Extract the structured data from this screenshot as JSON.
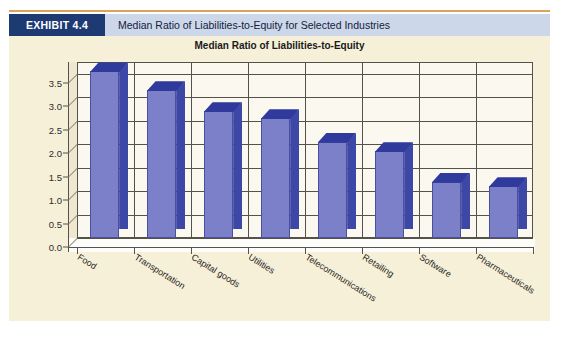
{
  "exhibit": {
    "badge_label": "EXHIBIT 4.4",
    "caption": "Median Ratio of Liabilities-to-Equity for Selected Industries",
    "badge_color": "#1e3a73",
    "caption_bg": "#ccd7ea",
    "panel_bg": "#f7f0d8",
    "rule_color": "#d9a55a"
  },
  "chart_data": {
    "type": "bar",
    "title": "Median Ratio of Liabilities-to-Equity",
    "xlabel": "",
    "ylabel": "",
    "ylim": [
      0.0,
      3.75
    ],
    "grid": true,
    "legend": "none",
    "style": "3d-column",
    "bar_color": "#7b80c8",
    "bar_side_color": "#3d47a6",
    "bar_top_color": "#2f3a9c",
    "ytick_labels": [
      "0.0",
      "0.5",
      "1.0",
      "1.5",
      "2.0",
      "2.5",
      "3.0",
      "3.5"
    ],
    "ytick_values": [
      0.0,
      0.5,
      1.0,
      1.5,
      2.0,
      2.5,
      3.0,
      3.5
    ],
    "categories": [
      "Food",
      "Transportation",
      "Capital goods",
      "Utilities",
      "Telecommunications",
      "Retailing",
      "Software",
      "Pharmaceuticals"
    ],
    "values": [
      3.55,
      3.15,
      2.7,
      2.55,
      2.05,
      1.85,
      1.2,
      1.1
    ]
  }
}
